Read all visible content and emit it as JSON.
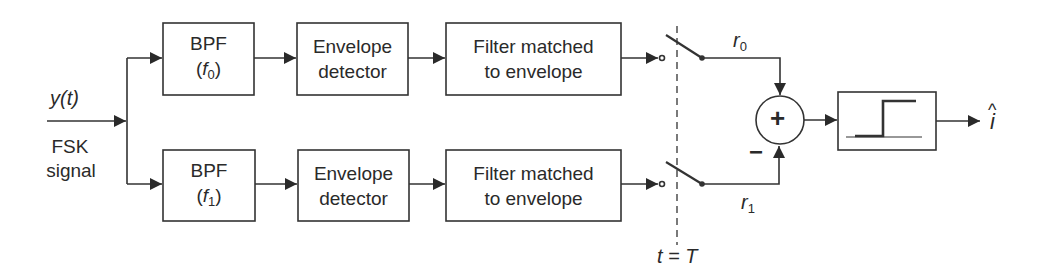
{
  "diagram": {
    "input": {
      "signal": "y(t)",
      "label_line1": "FSK",
      "label_line2": "signal"
    },
    "branches": [
      {
        "bpf": {
          "line1": "BPF",
          "freq_open": "(",
          "freq_var": "f",
          "freq_sub": "0",
          "freq_close": ")"
        },
        "envelope": {
          "line1": "Envelope",
          "line2": "detector"
        },
        "matched": {
          "line1": "Filter matched",
          "line2": "to envelope"
        },
        "output_var": "r",
        "output_sub": "0",
        "sign": "+"
      },
      {
        "bpf": {
          "line1": "BPF",
          "freq_open": "(",
          "freq_var": "f",
          "freq_sub": "1",
          "freq_close": ")"
        },
        "envelope": {
          "line1": "Envelope",
          "line2": "detector"
        },
        "matched": {
          "line1": "Filter matched",
          "line2": "to envelope"
        },
        "output_var": "r",
        "output_sub": "1",
        "sign": "−"
      }
    ],
    "sampler": {
      "label": "t = T"
    },
    "summer": {
      "symbol": "+"
    },
    "decision": {
      "icon": "step-threshold"
    },
    "output": {
      "symbol": "i",
      "hat": "^"
    },
    "colors": {
      "stroke": "#333333",
      "background": "#ffffff"
    }
  }
}
